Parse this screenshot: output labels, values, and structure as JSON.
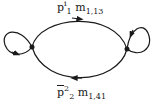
{
  "diagram": {
    "type": "state-transition-graph",
    "nodes": [
      {
        "id": "left",
        "x": 32,
        "y": 47,
        "self_loop": true
      },
      {
        "id": "right",
        "x": 127,
        "y": 49,
        "self_loop": true
      }
    ],
    "edges": [
      {
        "from": "left",
        "to": "right",
        "path": "top",
        "label": {
          "p": "p",
          "p_sup": "i",
          "p_sub": "1",
          "m": "m",
          "m_sub": "1,13"
        }
      },
      {
        "from": "right",
        "to": "left",
        "path": "bottom",
        "label": {
          "p": "p",
          "p_sup": "2",
          "p_sub": "2",
          "p_bar": true,
          "m": "m",
          "m_sub": "1,41"
        }
      }
    ],
    "stroke_color": "#1a1a1a"
  }
}
